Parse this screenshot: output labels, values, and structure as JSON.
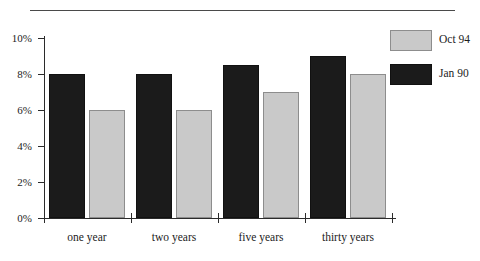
{
  "chart_data": {
    "type": "bar",
    "title": "",
    "subtitle": "",
    "xlabel": "",
    "ylabel": "",
    "categories": [
      "one year",
      "two years",
      "five years",
      "thirty years"
    ],
    "series": [
      {
        "name": "Jan 90",
        "color": "#1b1b1b",
        "values": [
          8,
          8,
          8.5,
          9
        ]
      },
      {
        "name": "Oct 94",
        "color": "#c9c9c9",
        "values": [
          6,
          6,
          7,
          8
        ]
      }
    ],
    "ylim": [
      0,
      10
    ],
    "ytick_values": [
      0,
      2,
      4,
      6,
      8,
      10
    ],
    "ytick_labels": [
      "0%",
      "2%",
      "4%",
      "6%",
      "8%",
      "10%"
    ],
    "grid": false,
    "legend_position": "right-top",
    "legend_order": [
      "Oct 94",
      "Jan 90"
    ]
  },
  "axes": {
    "y_ticks": [
      {
        "label": "10%",
        "value": 10
      },
      {
        "label": "8%",
        "value": 8
      },
      {
        "label": "6%",
        "value": 6
      },
      {
        "label": "4%",
        "value": 4
      },
      {
        "label": "2%",
        "value": 2
      },
      {
        "label": "0%",
        "value": 0
      }
    ],
    "x_categories": [
      "one year",
      "two years",
      "five years",
      "thirty years"
    ]
  },
  "legend": {
    "entries": [
      {
        "label": "Oct 94",
        "swatch": "light"
      },
      {
        "label": "Jan 90",
        "swatch": "dark"
      }
    ]
  },
  "colors": {
    "series_dark": "#1b1b1b",
    "series_light": "#c9c9c9",
    "axis": "#2b2b2b",
    "rule": "#4a4a4a",
    "text": "#1c1c1c",
    "background": "#ffffff"
  }
}
